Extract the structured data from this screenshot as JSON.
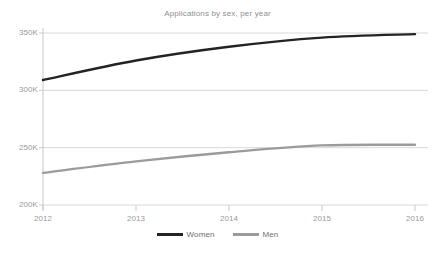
{
  "chart_data": {
    "type": "line",
    "title": "Applications by sex, per year",
    "xlabel": "",
    "ylabel": "",
    "x": [
      2012,
      2013,
      2014,
      2015,
      2016
    ],
    "xtick_labels": [
      "2012",
      "2013",
      "2014",
      "2015",
      "2016"
    ],
    "ytick_labels": [
      "350K",
      "300K",
      "250K",
      "200K"
    ],
    "ytick_values": [
      350000,
      300000,
      250000,
      200000
    ],
    "ylim": [
      200000,
      355000
    ],
    "xlim": [
      2012,
      2016
    ],
    "grid": "horizontal",
    "legend_position": "bottom-center",
    "series": [
      {
        "name": "Women",
        "color": "#232323",
        "values": [
          309000,
          326000,
          338000,
          346000,
          349000
        ]
      },
      {
        "name": "Men",
        "color": "#9b9b9b",
        "values": [
          228000,
          238000,
          246000,
          252000,
          252500
        ]
      }
    ]
  },
  "axis": {
    "ytick_labels": [
      "350K",
      "300K",
      "250K",
      "200K"
    ],
    "xtick_labels": [
      "2012",
      "2013",
      "2014",
      "2015",
      "2016"
    ]
  },
  "legend": {
    "items": [
      {
        "label": "Women",
        "color": "#232323"
      },
      {
        "label": "Men",
        "color": "#9b9b9b"
      }
    ]
  },
  "colors": {
    "background": "#ffffff",
    "gridline": "#d8d8d8",
    "axis": "#c9c9c9",
    "tick_text": "#9a9a9a",
    "title_text": "#8f8f8f",
    "women_line": "#232323",
    "men_line": "#9b9b9b"
  }
}
